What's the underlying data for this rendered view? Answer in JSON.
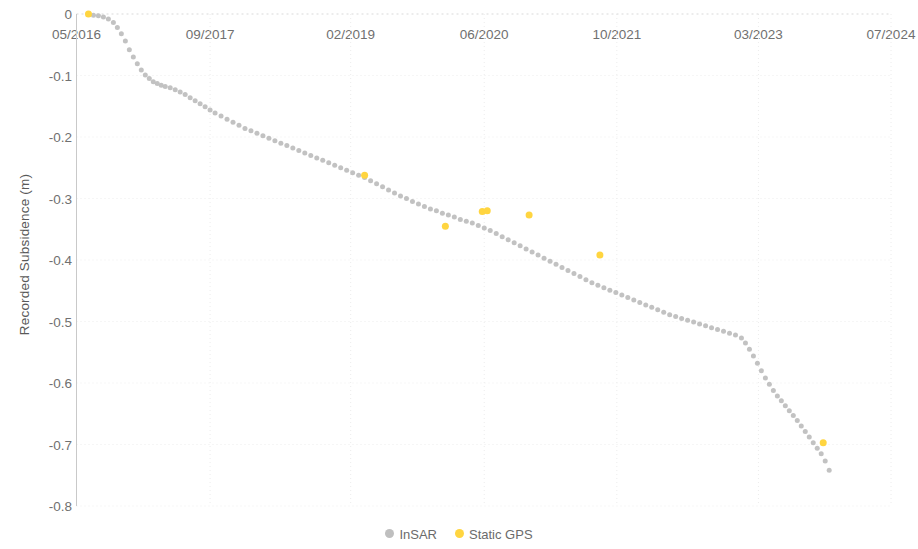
{
  "chart_data": {
    "type": "scatter",
    "title": "",
    "xlabel": "",
    "ylabel": "Recorded Subsidence (m)",
    "grid": true,
    "legend_position": "bottom",
    "xtick_labels": [
      "05/2016",
      "09/2017",
      "02/2019",
      "06/2020",
      "10/2021",
      "03/2023",
      "07/2024"
    ],
    "ytick_labels": [
      "0",
      "-0.1",
      "-0.2",
      "-0.3",
      "-0.4",
      "-0.5",
      "-0.6",
      "-0.7",
      "-0.8"
    ],
    "ytick_values": [
      0,
      -0.1,
      -0.2,
      -0.3,
      -0.4,
      -0.5,
      -0.6,
      -0.7,
      -0.8
    ],
    "ylim": [
      -0.8,
      0
    ],
    "xlim": [
      2016.33,
      2024.5
    ],
    "xtick_values": [
      2016.33,
      2017.67,
      2019.08,
      2020.42,
      2021.75,
      2023.17,
      2024.5
    ],
    "series": [
      {
        "name": "InSAR",
        "color": "#bfbfbf",
        "marker": "circle",
        "marker_size": 5,
        "points": [
          [
            2016.45,
            0.0
          ],
          [
            2016.5,
            -0.002
          ],
          [
            2016.55,
            -0.003
          ],
          [
            2016.6,
            -0.005
          ],
          [
            2016.65,
            -0.008
          ],
          [
            2016.7,
            -0.014
          ],
          [
            2016.74,
            -0.022
          ],
          [
            2016.78,
            -0.032
          ],
          [
            2016.82,
            -0.044
          ],
          [
            2016.86,
            -0.058
          ],
          [
            2016.9,
            -0.07
          ],
          [
            2016.94,
            -0.081
          ],
          [
            2016.98,
            -0.091
          ],
          [
            2017.02,
            -0.099
          ],
          [
            2017.06,
            -0.105
          ],
          [
            2017.1,
            -0.11
          ],
          [
            2017.14,
            -0.113
          ],
          [
            2017.18,
            -0.116
          ],
          [
            2017.22,
            -0.118
          ],
          [
            2017.27,
            -0.12
          ],
          [
            2017.32,
            -0.123
          ],
          [
            2017.37,
            -0.127
          ],
          [
            2017.42,
            -0.131
          ],
          [
            2017.47,
            -0.136
          ],
          [
            2017.52,
            -0.141
          ],
          [
            2017.57,
            -0.146
          ],
          [
            2017.62,
            -0.151
          ],
          [
            2017.67,
            -0.156
          ],
          [
            2017.72,
            -0.161
          ],
          [
            2017.78,
            -0.166
          ],
          [
            2017.84,
            -0.171
          ],
          [
            2017.9,
            -0.176
          ],
          [
            2017.96,
            -0.181
          ],
          [
            2018.02,
            -0.186
          ],
          [
            2018.08,
            -0.19
          ],
          [
            2018.14,
            -0.194
          ],
          [
            2018.2,
            -0.198
          ],
          [
            2018.26,
            -0.202
          ],
          [
            2018.32,
            -0.206
          ],
          [
            2018.38,
            -0.21
          ],
          [
            2018.44,
            -0.214
          ],
          [
            2018.5,
            -0.218
          ],
          [
            2018.56,
            -0.222
          ],
          [
            2018.62,
            -0.226
          ],
          [
            2018.68,
            -0.23
          ],
          [
            2018.74,
            -0.234
          ],
          [
            2018.8,
            -0.238
          ],
          [
            2018.86,
            -0.242
          ],
          [
            2018.92,
            -0.246
          ],
          [
            2018.98,
            -0.25
          ],
          [
            2019.04,
            -0.254
          ],
          [
            2019.1,
            -0.258
          ],
          [
            2019.16,
            -0.262
          ],
          [
            2019.22,
            -0.266
          ],
          [
            2019.28,
            -0.271
          ],
          [
            2019.34,
            -0.276
          ],
          [
            2019.4,
            -0.281
          ],
          [
            2019.46,
            -0.286
          ],
          [
            2019.52,
            -0.291
          ],
          [
            2019.58,
            -0.296
          ],
          [
            2019.64,
            -0.3
          ],
          [
            2019.7,
            -0.305
          ],
          [
            2019.76,
            -0.309
          ],
          [
            2019.82,
            -0.313
          ],
          [
            2019.88,
            -0.317
          ],
          [
            2019.94,
            -0.32
          ],
          [
            2020.0,
            -0.324
          ],
          [
            2020.06,
            -0.327
          ],
          [
            2020.12,
            -0.33
          ],
          [
            2020.18,
            -0.334
          ],
          [
            2020.24,
            -0.337
          ],
          [
            2020.3,
            -0.34
          ],
          [
            2020.36,
            -0.344
          ],
          [
            2020.42,
            -0.348
          ],
          [
            2020.48,
            -0.352
          ],
          [
            2020.54,
            -0.357
          ],
          [
            2020.6,
            -0.362
          ],
          [
            2020.66,
            -0.367
          ],
          [
            2020.72,
            -0.372
          ],
          [
            2020.78,
            -0.377
          ],
          [
            2020.84,
            -0.382
          ],
          [
            2020.9,
            -0.387
          ],
          [
            2020.96,
            -0.392
          ],
          [
            2021.02,
            -0.397
          ],
          [
            2021.08,
            -0.402
          ],
          [
            2021.14,
            -0.407
          ],
          [
            2021.2,
            -0.412
          ],
          [
            2021.26,
            -0.417
          ],
          [
            2021.32,
            -0.422
          ],
          [
            2021.38,
            -0.427
          ],
          [
            2021.44,
            -0.432
          ],
          [
            2021.5,
            -0.437
          ],
          [
            2021.56,
            -0.441
          ],
          [
            2021.62,
            -0.445
          ],
          [
            2021.68,
            -0.449
          ],
          [
            2021.74,
            -0.453
          ],
          [
            2021.8,
            -0.457
          ],
          [
            2021.86,
            -0.461
          ],
          [
            2021.92,
            -0.465
          ],
          [
            2021.98,
            -0.469
          ],
          [
            2022.04,
            -0.473
          ],
          [
            2022.1,
            -0.477
          ],
          [
            2022.16,
            -0.481
          ],
          [
            2022.22,
            -0.485
          ],
          [
            2022.28,
            -0.489
          ],
          [
            2022.34,
            -0.492
          ],
          [
            2022.4,
            -0.495
          ],
          [
            2022.46,
            -0.498
          ],
          [
            2022.52,
            -0.501
          ],
          [
            2022.58,
            -0.504
          ],
          [
            2022.64,
            -0.507
          ],
          [
            2022.7,
            -0.51
          ],
          [
            2022.76,
            -0.513
          ],
          [
            2022.82,
            -0.516
          ],
          [
            2022.88,
            -0.519
          ],
          [
            2022.94,
            -0.522
          ],
          [
            2023.0,
            -0.527
          ],
          [
            2023.04,
            -0.535
          ],
          [
            2023.08,
            -0.545
          ],
          [
            2023.12,
            -0.556
          ],
          [
            2023.16,
            -0.568
          ],
          [
            2023.2,
            -0.58
          ],
          [
            2023.24,
            -0.592
          ],
          [
            2023.28,
            -0.602
          ],
          [
            2023.32,
            -0.612
          ],
          [
            2023.36,
            -0.621
          ],
          [
            2023.4,
            -0.629
          ],
          [
            2023.44,
            -0.637
          ],
          [
            2023.48,
            -0.645
          ],
          [
            2023.52,
            -0.653
          ],
          [
            2023.56,
            -0.661
          ],
          [
            2023.6,
            -0.67
          ],
          [
            2023.64,
            -0.679
          ],
          [
            2023.68,
            -0.688
          ],
          [
            2023.72,
            -0.697
          ],
          [
            2023.76,
            -0.706
          ],
          [
            2023.8,
            -0.715
          ],
          [
            2023.84,
            -0.727
          ],
          [
            2023.88,
            -0.742
          ]
        ]
      },
      {
        "name": "Static GPS",
        "color": "#ffd540",
        "marker": "circle",
        "marker_size": 7,
        "points": [
          [
            2016.45,
            0.0
          ],
          [
            2019.22,
            -0.262
          ],
          [
            2020.03,
            -0.345
          ],
          [
            2020.4,
            -0.321
          ],
          [
            2020.45,
            -0.32
          ],
          [
            2020.87,
            -0.327
          ],
          [
            2021.58,
            -0.392
          ],
          [
            2023.82,
            -0.697
          ]
        ]
      }
    ]
  },
  "axes": {
    "y_title": "Recorded Subsidence (m)"
  },
  "legend": {
    "items": [
      {
        "label": "InSAR",
        "color": "#bfbfbf"
      },
      {
        "label": "Static GPS",
        "color": "#ffd540"
      }
    ]
  }
}
